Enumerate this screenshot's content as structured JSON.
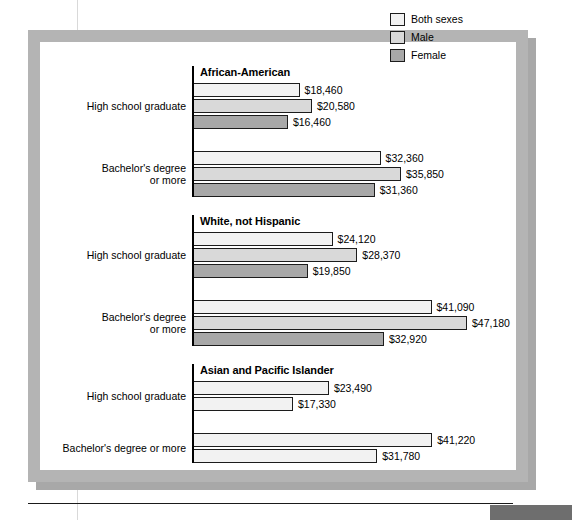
{
  "legend": {
    "items": [
      {
        "label": "Both sexes",
        "color": "#f2f2f2"
      },
      {
        "label": "Male",
        "color": "#d9d9d9"
      },
      {
        "label": "Female",
        "color": "#a8a8a8"
      }
    ]
  },
  "chart_data": {
    "type": "bar",
    "orientation": "horizontal",
    "title": "",
    "xlabel": "",
    "ylabel": "",
    "grid": false,
    "legend_position": "top-right",
    "axis_min": 0,
    "axis_max": 47180,
    "value_prefix": "$",
    "series": [
      {
        "name": "Both sexes",
        "color": "#f2f2f2"
      },
      {
        "name": "Male",
        "color": "#d9d9d9"
      },
      {
        "name": "Female",
        "color": "#a8a8a8"
      }
    ],
    "groups": [
      {
        "title": "African-American",
        "categories": [
          {
            "label": "High school graduate",
            "label_lines": [
              "High school graduate"
            ],
            "bars": [
              {
                "series": "Both sexes",
                "value": 18460,
                "label": "$18,460",
                "color": "#f2f2f2"
              },
              {
                "series": "Male",
                "value": 20580,
                "label": "$20,580",
                "color": "#d9d9d9"
              },
              {
                "series": "Female",
                "value": 16460,
                "label": "$16,460",
                "color": "#a8a8a8"
              }
            ]
          },
          {
            "label": "Bachelor's degree or more",
            "label_lines": [
              "Bachelor's degree",
              "or more"
            ],
            "bars": [
              {
                "series": "Both sexes",
                "value": 32360,
                "label": "$32,360",
                "color": "#f2f2f2"
              },
              {
                "series": "Male",
                "value": 35850,
                "label": "$35,850",
                "color": "#d9d9d9"
              },
              {
                "series": "Female",
                "value": 31360,
                "label": "$31,360",
                "color": "#a8a8a8"
              }
            ]
          }
        ]
      },
      {
        "title": "White, not Hispanic",
        "categories": [
          {
            "label": "High school graduate",
            "label_lines": [
              "High school graduate"
            ],
            "bars": [
              {
                "series": "Both sexes",
                "value": 24120,
                "label": "$24,120",
                "color": "#f2f2f2"
              },
              {
                "series": "Male",
                "value": 28370,
                "label": "$28,370",
                "color": "#d9d9d9"
              },
              {
                "series": "Female",
                "value": 19850,
                "label": "$19,850",
                "color": "#a8a8a8"
              }
            ]
          },
          {
            "label": "Bachelor's degree or more",
            "label_lines": [
              "Bachelor's degree",
              "or more"
            ],
            "bars": [
              {
                "series": "Both sexes",
                "value": 41090,
                "label": "$41,090",
                "color": "#f2f2f2"
              },
              {
                "series": "Male",
                "value": 47180,
                "label": "$47,180",
                "color": "#d9d9d9"
              },
              {
                "series": "Female",
                "value": 32920,
                "label": "$32,920",
                "color": "#a8a8a8"
              }
            ]
          }
        ]
      },
      {
        "title": "Asian and Pacific Islander",
        "categories": [
          {
            "label": "High school graduate",
            "label_lines": [
              "High school graduate"
            ],
            "bars": [
              {
                "series": "Both sexes",
                "value": 23490,
                "label": "$23,490",
                "color": "#f2f2f2"
              },
              {
                "series": "Male",
                "value": 17330,
                "label": "$17,330",
                "color": "#f2f2f2"
              }
            ]
          },
          {
            "label": "Bachelor's degree or more",
            "label_lines": [
              "Bachelor's degree or more"
            ],
            "bars": [
              {
                "series": "Both sexes",
                "value": 41220,
                "label": "$41,220",
                "color": "#f2f2f2"
              },
              {
                "series": "Male",
                "value": 31780,
                "label": "$31,780",
                "color": "#f2f2f2"
              }
            ]
          }
        ]
      }
    ]
  }
}
